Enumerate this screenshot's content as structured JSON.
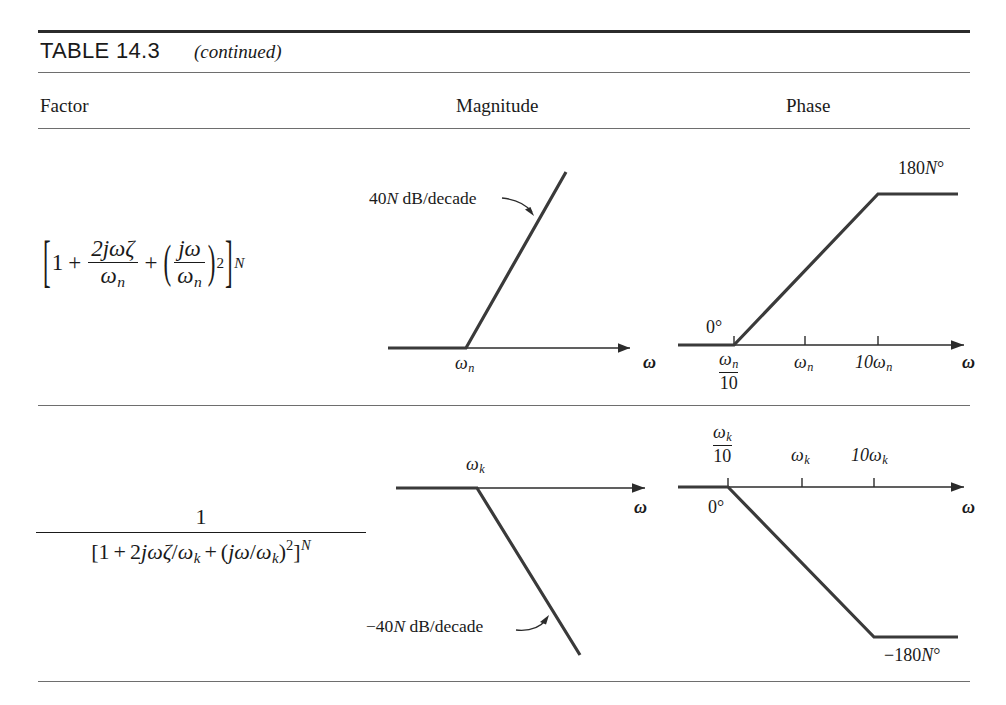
{
  "header": {
    "table_label": "TABLE 14.3",
    "continued": "(continued)"
  },
  "columns": {
    "factor": "Factor",
    "magnitude": "Magnitude",
    "phase": "Phase"
  },
  "rows": [
    {
      "factor": {
        "plain_text": "[1 + 2jωζ/ω_n + (jω/ω_n)^2]^N",
        "parts": {
          "bracket_open": "[",
          "one": "1",
          "plus_1": "+",
          "frac1_num": "2jωζ",
          "frac1_den": "ω",
          "frac1_den_sub": "n",
          "plus_2": "+",
          "paren_open": "(",
          "frac2_num": "jω",
          "frac2_den": "ω",
          "frac2_den_sub": "n",
          "paren_close": ")",
          "paren_exp": "2",
          "bracket_close": "]",
          "bracket_exp": "N"
        }
      },
      "magnitude": {
        "slope_label_value": "40",
        "slope_label_n": "N",
        "slope_label_units": "dB/decade",
        "break_tick_label": "ω",
        "break_tick_sub": "n",
        "axis_label": "ω",
        "shape": "flat-then-rising"
      },
      "phase": {
        "start_level": "0°",
        "end_level_value": "180",
        "end_level_n": "N",
        "end_level_deg": "°",
        "ticks": [
          {
            "num": "ω",
            "num_sub": "n",
            "den": "10",
            "stacked": true
          },
          {
            "label": "ω",
            "sub": "n",
            "stacked": false
          },
          {
            "label": "10ω",
            "sub": "n",
            "stacked": false
          }
        ],
        "axis_label": "ω",
        "shape": "flat-ramp-up-flat"
      }
    },
    {
      "factor": {
        "plain_text": "1 / [1 + 2jωζ/ω_k + (jω/ω_k)^2]^N",
        "parts": {
          "numerator": "1",
          "den_bracket_open": "[",
          "den_one": "1",
          "den_plus_1": "+",
          "den_two": "2",
          "den_j": "j",
          "den_omega": "ω",
          "den_zeta": "ζ",
          "den_slash_1": "/",
          "den_omega_k_1": "ω",
          "den_sub_k_1": "k",
          "den_plus_2": "+",
          "den_paren_open": "(",
          "den_j2": "j",
          "den_omega2": "ω",
          "den_slash_2": "/",
          "den_omega_k_2": "ω",
          "den_sub_k_2": "k",
          "den_paren_close": ")",
          "den_paren_exp": "2",
          "den_bracket_close": "]",
          "den_bracket_exp": "N"
        }
      },
      "magnitude": {
        "slope_label_value": "−40",
        "slope_label_n": "N",
        "slope_label_units": "dB/decade",
        "break_tick_label": "ω",
        "break_tick_sub": "k",
        "axis_label": "ω",
        "shape": "flat-then-falling"
      },
      "phase": {
        "start_level": "0°",
        "end_level_value": "−180",
        "end_level_n": "N",
        "end_level_deg": "°",
        "ticks": [
          {
            "num": "ω",
            "num_sub": "k",
            "den": "10",
            "stacked": true
          },
          {
            "label": "ω",
            "sub": "k",
            "stacked": false
          },
          {
            "label": "10ω",
            "sub": "k",
            "stacked": false
          }
        ],
        "axis_label": "ω",
        "shape": "flat-ramp-down-flat"
      }
    }
  ],
  "style": {
    "ink": "#1a1a1a",
    "rule_color": "#3a3a3a",
    "background": "#ffffff"
  }
}
